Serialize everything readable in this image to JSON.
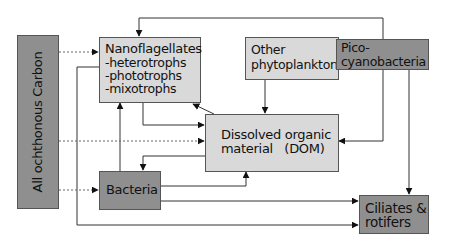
{
  "diagram": {
    "title": "",
    "colors": {
      "light_box": "#d9d9d9",
      "dark_box": "#8f8f8f",
      "border": "#555555",
      "line": "#333333",
      "dotted_line": "#666666"
    },
    "nodes": {
      "allochthonous": {
        "label": "All ochthonous Carbon",
        "style": "dark"
      },
      "nanoflagellates": {
        "label_lines": [
          "Nanoflagellates",
          "-heterotrophs",
          "-phototrophs",
          "-mixotrophs"
        ],
        "style": "light"
      },
      "other_phyto": {
        "label_lines": [
          "Other",
          "phytoplankton"
        ],
        "style": "light"
      },
      "pico": {
        "label_lines": [
          "Pico-",
          "cyanobacteria"
        ],
        "style": "dark"
      },
      "dom": {
        "label_lines": [
          "Dissolved organic",
          "material   (DOM)"
        ],
        "style": "light"
      },
      "bacteria": {
        "label": "Bacteria",
        "style": "dark"
      },
      "ciliates": {
        "label_lines": [
          "Ciliates &",
          "rotifers"
        ],
        "style": "dark"
      }
    },
    "edges": [
      {
        "from": "Picocyanobacteria",
        "to": "Nanoflagellates",
        "style": "solid"
      },
      {
        "from": "All ochthonous Carbon",
        "to": "Nanoflagellates",
        "style": "dotted"
      },
      {
        "from": "All ochthonous Carbon",
        "to": "Dissolved organic material (DOM)",
        "style": "dotted"
      },
      {
        "from": "All ochthonous Carbon",
        "to": "Bacteria",
        "style": "dotted"
      },
      {
        "from": "Nanoflagellates",
        "to": "Ciliates & rotifers",
        "style": "solid"
      },
      {
        "from": "Nanoflagellates",
        "to": "Dissolved organic material (DOM)",
        "style": "solid"
      },
      {
        "from": "Dissolved organic material (DOM)",
        "to": "Nanoflagellates",
        "style": "solid"
      },
      {
        "from": "Dissolved organic material (DOM)",
        "to": "Bacteria",
        "style": "solid"
      },
      {
        "from": "Bacteria",
        "to": "Nanoflagellates",
        "style": "solid"
      },
      {
        "from": "Bacteria",
        "to": "Dissolved organic material (DOM)",
        "style": "solid"
      },
      {
        "from": "Bacteria",
        "to": "Ciliates & rotifers",
        "style": "solid"
      },
      {
        "from": "Other phytoplankton",
        "to": "Dissolved organic material (DOM)",
        "style": "solid"
      },
      {
        "from": "Picocyanobacteria",
        "to": "Dissolved organic material (DOM)",
        "style": "solid"
      },
      {
        "from": "Picocyanobacteria",
        "to": "Ciliates & rotifers",
        "style": "solid"
      }
    ]
  }
}
